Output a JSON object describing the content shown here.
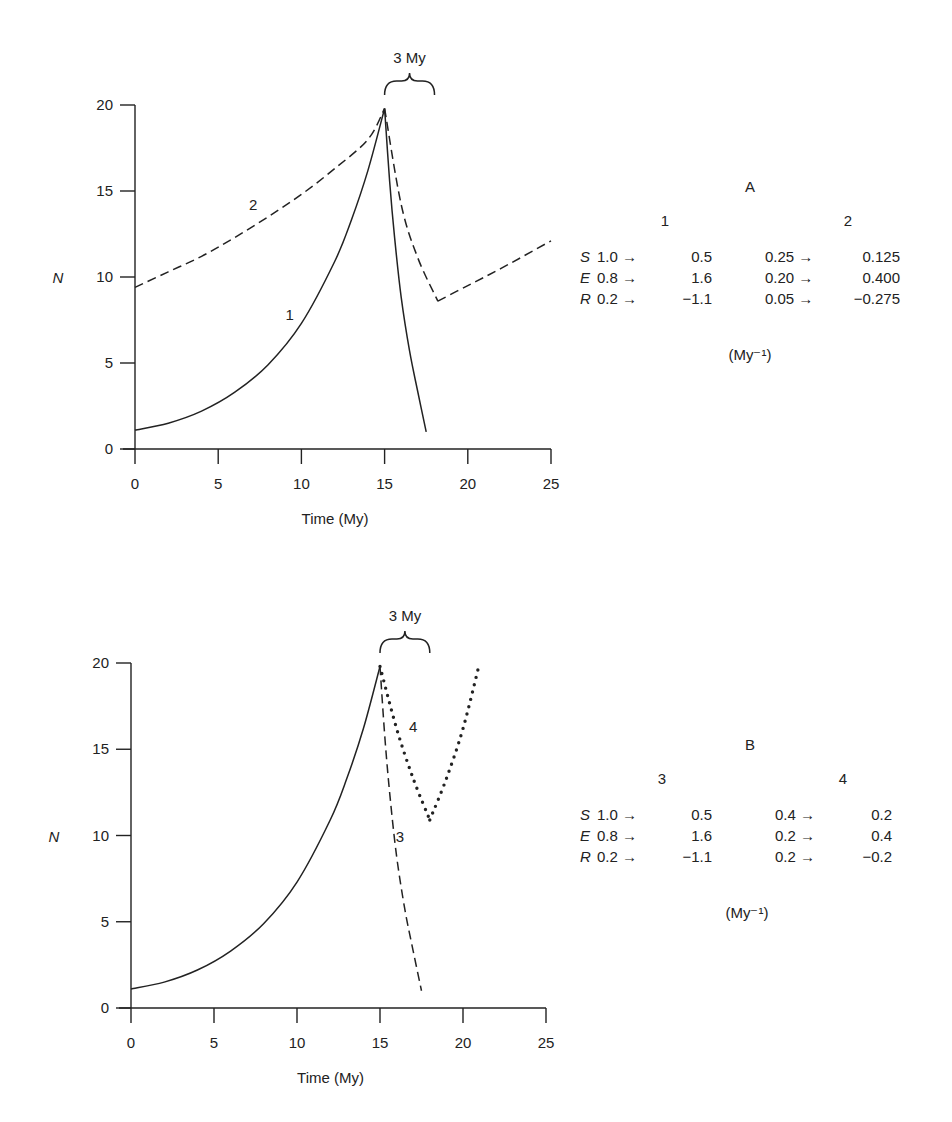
{
  "chart_data": [
    {
      "id": "A",
      "type": "line",
      "title": "A",
      "xlabel": "Time (My)",
      "ylabel": "N",
      "xlim": [
        0,
        25
      ],
      "ylim": [
        0,
        20
      ],
      "xticks": [
        0,
        5,
        10,
        15,
        20,
        25
      ],
      "yticks": [
        0,
        5,
        10,
        15,
        20
      ],
      "grid": false,
      "annotation": {
        "text": "3 My",
        "x_from": 15,
        "x_to": 18
      },
      "series": [
        {
          "name": "1",
          "style": "solid",
          "label_pos": [
            9.3,
            7.5
          ],
          "x": [
            0,
            2,
            4,
            6,
            8,
            10,
            12,
            13,
            14,
            15,
            15.3,
            15.6,
            16,
            16.5,
            17,
            17.5
          ],
          "y": [
            1.1,
            1.5,
            2.2,
            3.3,
            4.9,
            7.3,
            10.9,
            13.3,
            16.2,
            19.8,
            15.6,
            12.3,
            8.8,
            5.7,
            3.3,
            1.0
          ]
        },
        {
          "name": "2",
          "style": "dashed",
          "label_pos": [
            7.1,
            13.9
          ],
          "x": [
            0,
            2,
            4,
            6,
            8,
            10,
            12,
            14,
            15,
            16,
            17,
            18.2,
            20,
            22,
            25
          ],
          "y": [
            9.4,
            10.3,
            11.2,
            12.3,
            13.5,
            14.8,
            16.3,
            18.0,
            19.8,
            14.2,
            11.1,
            8.6,
            9.5,
            10.5,
            12.1
          ]
        }
      ],
      "rates": {
        "units": "(My⁻¹)",
        "columns": [
          {
            "name": "1",
            "rows": [
              {
                "param": "S",
                "from": "1.0",
                "to": "0.5"
              },
              {
                "param": "E",
                "from": "0.8",
                "to": "1.6"
              },
              {
                "param": "R",
                "from": "0.2",
                "to": "−1.1"
              }
            ]
          },
          {
            "name": "2",
            "rows": [
              {
                "param": "S",
                "from": "0.25",
                "to": "0.125"
              },
              {
                "param": "E",
                "from": "0.20",
                "to": "0.400"
              },
              {
                "param": "R",
                "from": "0.05",
                "to": "−0.275"
              }
            ]
          }
        ]
      }
    },
    {
      "id": "B",
      "type": "line",
      "title": "B",
      "xlabel": "Time (My)",
      "ylabel": "N",
      "xlim": [
        0,
        25
      ],
      "ylim": [
        0,
        20
      ],
      "xticks": [
        0,
        5,
        10,
        15,
        20,
        25
      ],
      "yticks": [
        0,
        5,
        10,
        15,
        20
      ],
      "grid": false,
      "annotation": {
        "text": "3 My",
        "x_from": 15,
        "x_to": 18
      },
      "series": [
        {
          "name": "growth",
          "style": "solid",
          "x": [
            0,
            2,
            4,
            6,
            8,
            10,
            12,
            13,
            14,
            15
          ],
          "y": [
            1.1,
            1.5,
            2.2,
            3.3,
            4.9,
            7.3,
            10.9,
            13.3,
            16.2,
            19.8
          ]
        },
        {
          "name": "3",
          "style": "dashed",
          "label_pos": [
            16.2,
            9.6
          ],
          "x": [
            15,
            15.3,
            15.6,
            16,
            16.5,
            17,
            17.5
          ],
          "y": [
            19.8,
            15.6,
            12.3,
            8.8,
            5.7,
            3.3,
            1.0
          ]
        },
        {
          "name": "4",
          "style": "dotted",
          "label_pos": [
            17.0,
            16.0
          ],
          "x": [
            15,
            16,
            17,
            18,
            19,
            20,
            21
          ],
          "y": [
            19.8,
            16.2,
            13.3,
            10.9,
            13.3,
            16.2,
            20.0
          ]
        }
      ],
      "rates": {
        "units": "(My⁻¹)",
        "columns": [
          {
            "name": "3",
            "rows": [
              {
                "param": "S",
                "from": "1.0",
                "to": "0.5"
              },
              {
                "param": "E",
                "from": "0.8",
                "to": "1.6"
              },
              {
                "param": "R",
                "from": "0.2",
                "to": "−1.1"
              }
            ]
          },
          {
            "name": "4",
            "rows": [
              {
                "param": "S",
                "from": "0.4",
                "to": "0.2"
              },
              {
                "param": "E",
                "from": "0.2",
                "to": "0.4"
              },
              {
                "param": "R",
                "from": "0.2",
                "to": "−0.2"
              }
            ]
          }
        ]
      }
    }
  ],
  "arrow": "→"
}
